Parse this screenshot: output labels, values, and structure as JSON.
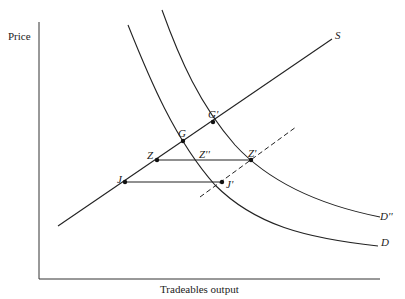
{
  "axes": {
    "y_label": "Price",
    "x_label": "Tradeables output"
  },
  "curves": {
    "supply": "S",
    "demand": "D",
    "demand_shifted": "D''"
  },
  "points": {
    "G": "G",
    "G_prime": "G'",
    "Z": "Z",
    "Z_dprime": "Z''",
    "Z_prime": "Z'",
    "J": "J",
    "J_prime": "J'"
  },
  "colors": {
    "line": "#222222",
    "background": "#ffffff"
  }
}
